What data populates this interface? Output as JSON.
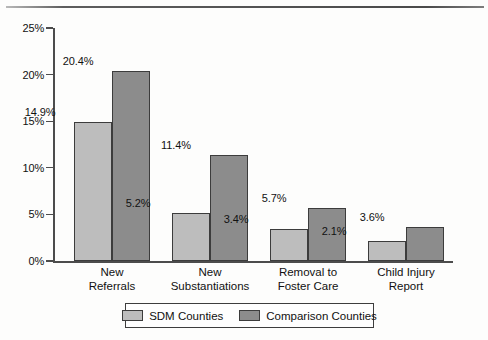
{
  "chart_data": {
    "type": "bar",
    "title": "",
    "xlabel": "",
    "ylabel": "",
    "ylim": [
      0,
      25
    ],
    "ytick_labels": [
      "0%",
      "5%",
      "10%",
      "15%",
      "20%",
      "25%"
    ],
    "ytick_values": [
      0,
      5,
      10,
      15,
      20,
      25
    ],
    "grid": false,
    "legend_position": "bottom",
    "categories": [
      "New\nReferrals",
      "New\nSubstantiations",
      "Removal to\nFoster Care",
      "Child Injury\nReport"
    ],
    "category_lines": [
      [
        "New",
        "Referrals"
      ],
      [
        "New",
        "Substantiations"
      ],
      [
        "Removal to",
        "Foster Care"
      ],
      [
        "Child Injury",
        "Report"
      ]
    ],
    "series": [
      {
        "name": "SDM Counties",
        "color": "#bdbdbd",
        "values": [
          14.9,
          5.2,
          3.4,
          2.1
        ],
        "labels": [
          "14.9%",
          "5.2%",
          "3.4%",
          "2.1%"
        ]
      },
      {
        "name": "Comparison Counties",
        "color": "#8c8c8c",
        "values": [
          20.4,
          11.4,
          5.7,
          3.6
        ],
        "labels": [
          "20.4%",
          "11.4%",
          "5.7%",
          "3.6%"
        ]
      }
    ]
  },
  "legend": {
    "items": [
      {
        "label": "SDM Counties",
        "color": "#bdbdbd"
      },
      {
        "label": "Comparison Counties",
        "color": "#8c8c8c"
      }
    ]
  }
}
